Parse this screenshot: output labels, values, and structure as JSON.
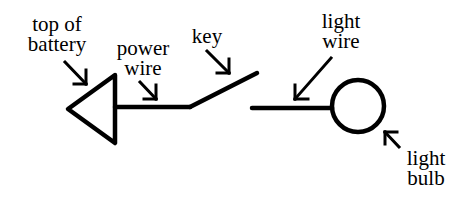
{
  "diagram": {
    "labels": {
      "battery": [
        "top of",
        "battery"
      ],
      "power_wire": [
        "power",
        "wire"
      ],
      "key": [
        "key"
      ],
      "light_wire": [
        "light",
        "wire"
      ],
      "light_bulb": [
        "light",
        "bulb"
      ]
    },
    "colors": {
      "stroke": "#000000",
      "background": "#ffffff"
    }
  }
}
